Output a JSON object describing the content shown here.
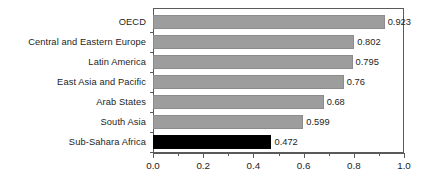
{
  "chart_data": {
    "type": "bar",
    "orientation": "horizontal",
    "title": "",
    "subtitle": "",
    "xlabel": "",
    "ylabel": "",
    "xlim": [
      0.0,
      1.0
    ],
    "xticks": [
      "0.0",
      "0.2",
      "0.4",
      "0.6",
      "0.8",
      "1.0"
    ],
    "xtick_values": [
      0.0,
      0.2,
      0.4,
      0.6,
      0.8,
      1.0
    ],
    "minor_tick_values": [
      0.1,
      0.3,
      0.5,
      0.7,
      0.9
    ],
    "grid": false,
    "legend": "none",
    "categories": [
      "OECD",
      "Central and Eastern Europe",
      "Latin America",
      "East Asia and Pacific",
      "Arab States",
      "South Asia",
      "Sub-Sahara Africa"
    ],
    "values": [
      0.923,
      0.802,
      0.795,
      0.76,
      0.68,
      0.599,
      0.472
    ],
    "value_labels": [
      "0.923",
      "0.802",
      "0.795",
      "0.76",
      "0.68",
      "0.599",
      "0.472"
    ],
    "bar_colors": [
      "#9d9d9d",
      "#9d9d9d",
      "#9d9d9d",
      "#9d9d9d",
      "#9d9d9d",
      "#9d9d9d",
      "#000000"
    ],
    "highlighted_category": "Sub-Sahara Africa",
    "colors": {
      "bar_gray": "#9d9d9d",
      "bar_highlight": "#000000",
      "axis": "#5a5a5a",
      "text": "#1d1d1d",
      "background": "#ffffff"
    }
  }
}
